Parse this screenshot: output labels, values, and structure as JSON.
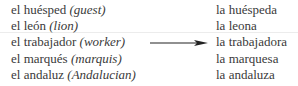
{
  "masculine": [
    {
      "word": "el huésped",
      "gloss": "(guest)"
    },
    {
      "word": "el león",
      "gloss": "(lion)"
    },
    {
      "word": "el trabajador",
      "gloss": "(worker)"
    },
    {
      "word": "el marqués",
      "gloss": "(marquis)"
    },
    {
      "word": "el andaluz",
      "gloss": "(Andalucian)"
    }
  ],
  "feminine": [
    "la huéspeda",
    "la leona",
    "la trabajadora",
    "la marquesa",
    "la andaluza"
  ],
  "arrow_icon": "right-arrow"
}
